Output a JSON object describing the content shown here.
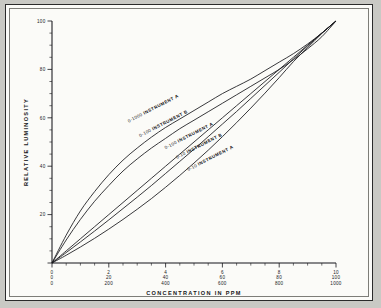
{
  "figure": {
    "background": "#c9c9c4",
    "sheet_color": "#fbfbf8",
    "ink_color": "#15151a"
  },
  "chart_data": {
    "type": "line",
    "title": "",
    "xlabel": "CONCENTRATION IN PPM",
    "ylabel": "RELATIVE LUMINOSITY",
    "grid": false,
    "legend_position": "inline-on-curves",
    "xlim": [
      0,
      100
    ],
    "ylim": [
      0,
      100
    ],
    "x_major_ticks": [
      0,
      20,
      40,
      60,
      80,
      100
    ],
    "x_tick_scales": [
      {
        "name": "0-10 scale",
        "labels": [
          "0",
          "2",
          "4",
          "6",
          "8",
          "10"
        ]
      },
      {
        "name": "0-100 scale",
        "labels": [
          "0",
          "20",
          "40",
          "60",
          "80",
          "100"
        ]
      },
      {
        "name": "0-1000 scale",
        "labels": [
          "0",
          "200",
          "400",
          "600",
          "800",
          "1000"
        ]
      }
    ],
    "x_minor_tick_step": 5,
    "y_major_ticks": [
      0,
      20,
      40,
      60,
      80,
      100
    ],
    "y_tick_labels": [
      "",
      "20",
      "40",
      "60",
      "80",
      "100"
    ],
    "y_minor_tick_step": 5,
    "x": [
      0,
      5,
      10,
      15,
      20,
      25,
      30,
      35,
      40,
      45,
      50,
      55,
      60,
      65,
      70,
      75,
      80,
      85,
      90,
      95,
      100
    ],
    "series": [
      {
        "name": "0-1000 INSTRUMENT A",
        "range_label": "0-1000",
        "instrument_label": "INSTRUMENT  A",
        "values": [
          0,
          11.5,
          21.5,
          29.5,
          36.5,
          42.5,
          47.5,
          52.0,
          56.0,
          59.5,
          63.0,
          66.5,
          70.0,
          73.0,
          76.0,
          79.5,
          83.0,
          86.5,
          90.5,
          95.0,
          100
        ]
      },
      {
        "name": "0-100 INSTRUMENT B",
        "range_label": "0-100",
        "instrument_label": "INSTRUMENT  B",
        "values": [
          0,
          9.5,
          18.0,
          25.5,
          32.0,
          38.0,
          43.0,
          47.5,
          51.5,
          55.5,
          59.0,
          62.5,
          66.0,
          69.5,
          73.0,
          76.5,
          80.0,
          84.0,
          88.5,
          93.5,
          100
        ]
      },
      {
        "name": "0-100 INSTRUMENT A",
        "range_label": "0-100",
        "instrument_label": "INSTRUMENT  A",
        "values": [
          0,
          5.0,
          10.0,
          15.0,
          20.0,
          25.0,
          30.0,
          35.0,
          40.0,
          45.0,
          50.0,
          55.0,
          60.0,
          65.0,
          70.0,
          75.0,
          80.0,
          85.0,
          90.0,
          95.0,
          100
        ]
      },
      {
        "name": "0-10 INSTRUMENT B",
        "range_label": "0-10",
        "instrument_label": "INSTRUMENT  B",
        "values": [
          0,
          4.3,
          8.7,
          13.2,
          17.8,
          22.5,
          27.2,
          32.0,
          37.0,
          42.0,
          47.0,
          52.2,
          57.4,
          62.6,
          68.0,
          73.4,
          78.8,
          84.3,
          89.7,
          95.0,
          100
        ]
      },
      {
        "name": "0-10 INSTRUMENT A",
        "range_label": "0-10",
        "instrument_label": "INSTRUMENT  A",
        "values": [
          0,
          3.2,
          6.6,
          10.2,
          14.0,
          18.0,
          22.2,
          26.6,
          31.3,
          36.2,
          41.3,
          46.6,
          52.2,
          58.0,
          64.0,
          70.2,
          76.6,
          83.2,
          89.0,
          94.8,
          100
        ]
      }
    ],
    "annotations": [
      {
        "text": "0-1000  INSTRUMENT  A",
        "x": 27,
        "y": 58
      },
      {
        "text": "0-100  INSTRUMENT  B",
        "x": 31,
        "y": 52
      },
      {
        "text": "0-100  INSTRUMENT  A",
        "x": 40,
        "y": 47
      },
      {
        "text": "0-10  INSTRUMENT  B",
        "x": 44,
        "y": 43
      },
      {
        "text": "0-10  INSTRUMENT  A",
        "x": 48,
        "y": 38
      }
    ]
  }
}
